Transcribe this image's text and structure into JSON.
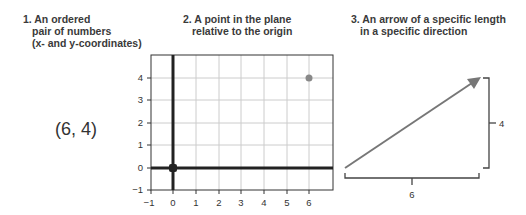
{
  "captions": [
    {
      "lines": [
        "1. An ordered",
        "pair of numbers",
        "(x- and y-coordinates)"
      ]
    },
    {
      "lines": [
        "2. A point in the plane",
        "relative to the origin"
      ]
    },
    {
      "lines": [
        "3. An arrow of a specific length",
        "in a specific direction"
      ]
    }
  ],
  "pair_text": "(6, 4)",
  "plot": {
    "x_ticks": [
      "−1",
      "0",
      "1",
      "2",
      "3",
      "4",
      "5",
      "6"
    ],
    "y_ticks": [
      "4",
      "3",
      "2",
      "1",
      "0",
      "−1"
    ],
    "point": {
      "x": 6,
      "y": 4,
      "color": "#888888"
    },
    "origin_color": "#222222"
  },
  "vector": {
    "dx_label": "6",
    "dy_label": "4",
    "arrow_color": "#777777",
    "bracket_color": "#444444"
  }
}
